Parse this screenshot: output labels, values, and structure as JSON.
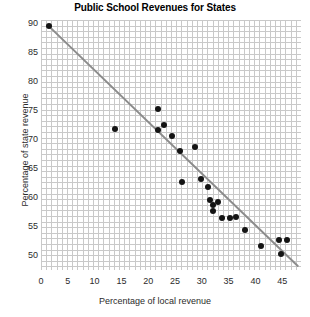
{
  "chart_data": {
    "type": "scatter",
    "title": "Public School Revenues for States",
    "xlabel": "Percentage of local revenue",
    "ylabel": "Percentage of state revenue",
    "xlim": [
      0,
      48.5
    ],
    "ylim": [
      47.5,
      90.5
    ],
    "xticks": [
      0,
      5,
      10,
      15,
      20,
      25,
      30,
      35,
      40,
      45
    ],
    "yticks": [
      50,
      55,
      60,
      65,
      70,
      75,
      80,
      85,
      90
    ],
    "grid": true,
    "grid_color": "#c9c9c9",
    "legend": null,
    "marker_color": "#141414",
    "trendline": {
      "visible": true,
      "color": "#8c8c8c",
      "x_start": 1.5,
      "y_start": 89.4,
      "x_end": 47.9,
      "y_end": 48.2
    },
    "points": [
      {
        "x": 1.5,
        "y": 89.4
      },
      {
        "x": 13.8,
        "y": 71.8
      },
      {
        "x": 21.9,
        "y": 75.2
      },
      {
        "x": 21.9,
        "y": 71.6
      },
      {
        "x": 24.4,
        "y": 70.5
      },
      {
        "x": 22.9,
        "y": 72.5
      },
      {
        "x": 26.0,
        "y": 67.9
      },
      {
        "x": 28.7,
        "y": 68.6
      },
      {
        "x": 26.3,
        "y": 62.7
      },
      {
        "x": 29.9,
        "y": 63.2
      },
      {
        "x": 31.1,
        "y": 61.8
      },
      {
        "x": 32.1,
        "y": 58.7
      },
      {
        "x": 32.1,
        "y": 57.7
      },
      {
        "x": 33.8,
        "y": 56.4
      },
      {
        "x": 35.2,
        "y": 56.4
      },
      {
        "x": 36.3,
        "y": 56.7
      },
      {
        "x": 31.6,
        "y": 59.6
      },
      {
        "x": 41.0,
        "y": 51.6
      },
      {
        "x": 44.4,
        "y": 52.7
      },
      {
        "x": 45.8,
        "y": 52.7
      },
      {
        "x": 44.8,
        "y": 50.2
      },
      {
        "x": 38.0,
        "y": 54.3
      },
      {
        "x": 33.0,
        "y": 59.2
      }
    ]
  }
}
